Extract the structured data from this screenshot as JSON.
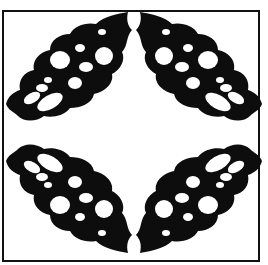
{
  "figure": {
    "colors": {
      "ink": "#0d0d0d",
      "paper": "#ffffff"
    },
    "leaves": [
      {
        "position": "top-left"
      },
      {
        "position": "top-right"
      },
      {
        "position": "bottom-left"
      },
      {
        "position": "bottom-right"
      }
    ]
  }
}
